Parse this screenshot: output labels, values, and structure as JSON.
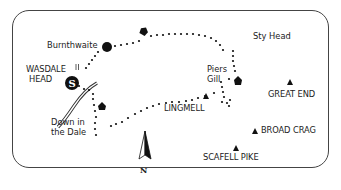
{
  "map": {
    "title": "",
    "colors": {
      "ink": "#111111",
      "frame": "#444444",
      "background": "#ffffff"
    },
    "places": [
      {
        "id": "burnthwaite",
        "label": "Burnthwaite",
        "type": "settlement-dot"
      },
      {
        "id": "wasdale-head",
        "label": "WASDALE HEAD",
        "line1": "WASDALE",
        "line2": "HEAD",
        "type": "start"
      },
      {
        "id": "sty-head",
        "label": "Sty Head",
        "type": "text"
      },
      {
        "id": "piers-gill",
        "label": "Piers Gill",
        "line1": "Piers",
        "line2": "Gill",
        "type": "text"
      },
      {
        "id": "down-in-the-dale",
        "label": "Down in the Dale",
        "line1": "Down in",
        "line2": "the Dale",
        "type": "text"
      }
    ],
    "summits": [
      {
        "id": "lingmell",
        "label": "LINGMELL"
      },
      {
        "id": "great-end",
        "label": "GREAT END"
      },
      {
        "id": "broad-crag",
        "label": "BROAD CRAG"
      },
      {
        "id": "scafell-pike",
        "label": "SCAFELL PIKE"
      }
    ],
    "start_marker": "S",
    "compass": {
      "label": "N"
    },
    "icons": [
      "start-marker-icon",
      "settlement-dot-icon",
      "direction-arrow-icon",
      "summit-triangle-icon",
      "north-arrow-icon",
      "road-icon"
    ]
  }
}
